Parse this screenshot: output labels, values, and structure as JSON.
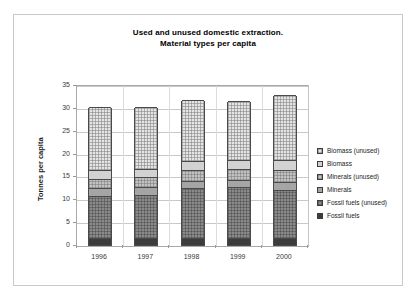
{
  "chart_data": {
    "type": "bar",
    "subtype": "stacked-bar",
    "title": "Used and unused domestic extraction.",
    "subtitle": "Material types per capita",
    "xlabel": "",
    "ylabel": "Tonnes per capita",
    "ylim": [
      0,
      35
    ],
    "ytick_step": 5,
    "yticks": [
      "0",
      "5",
      "10",
      "15",
      "20",
      "25",
      "30",
      "35"
    ],
    "ytick_values": [
      0,
      5,
      10,
      15,
      20,
      25,
      30,
      35
    ],
    "grid": true,
    "legend_position": "right",
    "categories": [
      "1996",
      "1997",
      "1998",
      "1999",
      "2000"
    ],
    "stack_order_bottom_to_top": [
      "Fossil fuels",
      "Fossil fuels (unused)",
      "Minerals",
      "Minerals (unused)",
      "Biomass",
      "Biomass (unused)"
    ],
    "series": [
      {
        "name": "Fossil fuels",
        "color": "#3c3c3c",
        "pattern": "solid-dark",
        "values": [
          1.5,
          1.5,
          1.6,
          1.6,
          1.6
        ]
      },
      {
        "name": "Fossil fuels (unused)",
        "color": "#8a8a8a",
        "pattern": "hatched-dark",
        "values": [
          9.3,
          9.4,
          10.8,
          11.1,
          10.5
        ]
      },
      {
        "name": "Minerals",
        "color": "#a5a5a5",
        "pattern": "solid-mid",
        "values": [
          1.6,
          1.7,
          1.7,
          1.6,
          1.6
        ]
      },
      {
        "name": "Minerals (unused)",
        "color": "#c2c2c2",
        "pattern": "hatched-mid",
        "values": [
          2.1,
          2.2,
          2.3,
          2.3,
          2.7
        ]
      },
      {
        "name": "Biomass",
        "color": "#d2d2d2",
        "pattern": "solid-light",
        "values": [
          2.0,
          1.9,
          1.9,
          2.0,
          2.1
        ]
      },
      {
        "name": "Biomass (unused)",
        "color": "#e4e4e4",
        "pattern": "hatched-light",
        "values": [
          13.8,
          13.6,
          13.4,
          13.0,
          14.3
        ]
      }
    ],
    "totals": [
      30.3,
      30.3,
      31.7,
      31.6,
      32.8
    ]
  },
  "legend": {
    "items": [
      {
        "label": "Biomass (unused)",
        "fill_class": "fill-biomass-unused"
      },
      {
        "label": "Biomass",
        "fill_class": "fill-biomass"
      },
      {
        "label": "Minerals (unused)",
        "fill_class": "fill-minerals-unused"
      },
      {
        "label": "Minerals",
        "fill_class": "fill-minerals"
      },
      {
        "label": "Fossil fuels (unused)",
        "fill_class": "fill-fossil-unused"
      },
      {
        "label": "Fossil fuels",
        "fill_class": "fill-fossil"
      }
    ]
  }
}
